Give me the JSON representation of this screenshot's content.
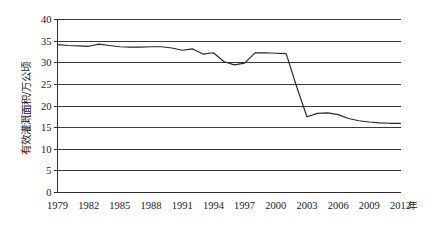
{
  "chart_data": {
    "type": "line",
    "title": "",
    "subtitle": "",
    "xlabel": "年",
    "ylabel": "有效灌溉面积/万公顷",
    "xlim": [
      1979,
      2012
    ],
    "ylim": [
      0,
      40
    ],
    "y_ticks": [
      0,
      5,
      10,
      15,
      20,
      25,
      30,
      35,
      40
    ],
    "y_tick_labels": [
      "0",
      "5",
      "10",
      "15",
      "20",
      "25",
      "30",
      "35",
      "40"
    ],
    "x_ticks": [
      1979,
      1982,
      1985,
      1988,
      1991,
      1994,
      1997,
      2000,
      2003,
      2006,
      2009,
      2012
    ],
    "x_tick_labels": [
      "1979",
      "1982",
      "1985",
      "1988",
      "1991",
      "1994",
      "1997",
      "2000",
      "2003",
      "2006",
      "2009",
      "2012"
    ],
    "grid": "horizontal",
    "legend": "none",
    "legend_position": "none",
    "line_color": "#262626",
    "grid_color": "#3a3a3a",
    "axis_color": "#2b2b2b",
    "background_color": "#ffffff",
    "x": [
      1979,
      1980,
      1981,
      1982,
      1983,
      1984,
      1985,
      1986,
      1987,
      1988,
      1989,
      1990,
      1991,
      1992,
      1993,
      1994,
      1995,
      1996,
      1997,
      1998,
      1999,
      2000,
      2001,
      2002,
      2003,
      2004,
      2005,
      2006,
      2007,
      2008,
      2009,
      2010,
      2011,
      2012
    ],
    "series": [
      {
        "name": "有效灌溉面积",
        "values": [
          34.2,
          34.0,
          33.9,
          33.8,
          34.3,
          34.0,
          33.7,
          33.6,
          33.6,
          33.7,
          33.7,
          33.4,
          32.9,
          33.2,
          32.0,
          32.3,
          30.3,
          29.5,
          29.9,
          32.3,
          32.3,
          32.2,
          32.1,
          24.5,
          17.5,
          18.3,
          18.4,
          18.0,
          17.1,
          16.6,
          16.3,
          16.1,
          16.0,
          16.0
        ]
      }
    ]
  },
  "axis": {
    "x_unit": "年"
  }
}
